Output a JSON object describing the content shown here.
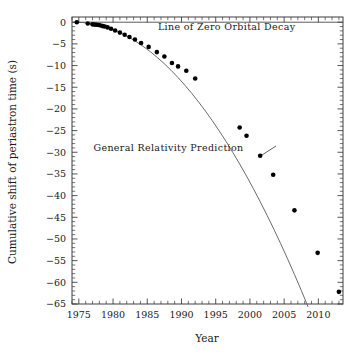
{
  "chart_data": {
    "type": "line",
    "title": "",
    "xlabel": "Year",
    "ylabel": "Cumulative shift of periastron time (s)",
    "xlim": [
      1974.0,
      2013.6
    ],
    "ylim": [
      -65,
      1.2
    ],
    "grid": false,
    "legend_position": "none",
    "x_ticks_major": [
      1975,
      1980,
      1985,
      1990,
      1995,
      2000,
      2005,
      2010
    ],
    "x_tick_labels": [
      "1975",
      "1980",
      "1985",
      "1990",
      "1995",
      "2000",
      "2005",
      "2010"
    ],
    "x_tick_minor_step": 1,
    "y_ticks_major": [
      0,
      -5,
      -10,
      -15,
      -20,
      -25,
      -30,
      -35,
      -40,
      -45,
      -50,
      -55,
      -60,
      -65
    ],
    "y_tick_labels": [
      "0",
      "−5",
      "−10",
      "−15",
      "−20",
      "−25",
      "−30",
      "−35",
      "−40",
      "−45",
      "−50",
      "−55",
      "−60",
      "−65"
    ],
    "y_tick_minor_step": 1,
    "series": [
      {
        "name": "General Relativity Prediction",
        "type": "line",
        "color": "#5a5a5a",
        "x": [
          1974.6,
          1975.5,
          1976.5,
          1977.5,
          1978.5,
          1979.5,
          1980.5,
          1981.5,
          1982.5,
          1983.5,
          1984.5,
          1985.5,
          1986.5,
          1987.5,
          1988.5,
          1989.5,
          1990.5,
          1991.5,
          1992.5,
          1993.5,
          1994.5,
          1995.5,
          1996.5,
          1997.5,
          1998.5,
          1999.5,
          2000.5,
          2001.5,
          2002.5,
          2003.5,
          2004.5,
          2005.5,
          2006.5,
          2007.5,
          2008.5,
          2009.5,
          2010.5,
          2011.5,
          2012.5,
          2013.2
        ],
        "y": [
          0.0,
          -0.07,
          -0.24,
          -0.52,
          -0.92,
          -1.43,
          -2.05,
          -2.79,
          -3.64,
          -4.61,
          -5.69,
          -6.88,
          -8.18,
          -9.6,
          -11.13,
          -12.78,
          -14.54,
          -16.41,
          -18.4,
          -20.5,
          -22.71,
          -25.04,
          -27.48,
          -30.04,
          -32.71,
          -35.49,
          -38.39,
          -41.4,
          -44.52,
          -47.76,
          -51.11,
          -54.58,
          -58.16,
          -61.85,
          -65.66,
          -69.58,
          -73.62,
          -77.77,
          -82.03,
          -84.1
        ]
      },
      {
        "name": "Observed cumulative period shift",
        "type": "scatter",
        "color": "#000000",
        "marker": "filled-circle",
        "x": [
          1974.7,
          1976.3,
          1977.0,
          1977.3,
          1977.6,
          1977.9,
          1978.2,
          1978.5,
          1978.8,
          1979.2,
          1979.7,
          1980.3,
          1981.0,
          1981.7,
          1982.4,
          1983.2,
          1984.1,
          1985.2,
          1986.4,
          1987.5,
          1988.6,
          1989.5,
          1990.7,
          1992.0,
          1998.5,
          1999.5,
          2001.5,
          2003.4,
          2006.5,
          2009.9,
          2013.0
        ],
        "y": [
          0.0,
          -0.3,
          -0.5,
          -0.55,
          -0.6,
          -0.65,
          -0.75,
          -0.9,
          -1.0,
          -1.2,
          -1.5,
          -1.9,
          -2.4,
          -2.9,
          -3.4,
          -4.0,
          -4.8,
          -5.7,
          -6.9,
          -7.9,
          -9.4,
          -10.2,
          -11.2,
          -13.0,
          -24.3,
          -26.2,
          -30.8,
          -35.2,
          -43.4,
          -53.2,
          -62.2
        ]
      }
    ],
    "annotations": [
      {
        "id": "zero-decay-label",
        "text": "Line of Zero Orbital Decay",
        "x": 1996.6,
        "y": -1.9,
        "anchor": "middle"
      },
      {
        "id": "gr-prediction-label",
        "text": "General Relativity Prediction",
        "x": 1988.1,
        "y": -29.6,
        "anchor": "middle"
      }
    ],
    "reference_lines": [
      {
        "id": "zero-orbital-decay-line",
        "orientation": "horizontal",
        "value": 0,
        "color": "#4a4a4a"
      }
    ]
  },
  "axis": {
    "x_title": "Year",
    "y_title": "Cumulative shift of periastron time (s)"
  },
  "annotations": {
    "zero_decay": "Line of Zero Orbital Decay",
    "gr_prediction": "General Relativity Prediction"
  },
  "colors": {
    "frame": "#2b2b2b",
    "curve": "#5a5a5a",
    "points": "#000000",
    "zero_line": "#4a4a4a",
    "background": "#ffffff",
    "text": "#1a1a1a"
  }
}
